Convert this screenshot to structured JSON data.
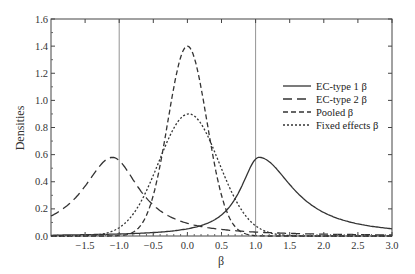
{
  "chart_data": {
    "type": "line",
    "title": "",
    "xlabel": "β",
    "ylabel": "Densities",
    "xlim": [
      -2.0,
      3.0
    ],
    "ylim": [
      0.0,
      1.6
    ],
    "grid": false,
    "legend_position": "right-center inside",
    "x_ticks": [
      -1.5,
      -1.0,
      -0.5,
      0.0,
      0.5,
      1.0,
      1.5,
      2.0,
      2.5,
      3.0
    ],
    "x_tick_labels": [
      "−1.5",
      "−1.0",
      "−0.5",
      "0.0",
      "0.5",
      "1.0",
      "1.5",
      "2.0",
      "2.5",
      "3.0"
    ],
    "y_ticks": [
      0.0,
      0.2,
      0.4,
      0.6,
      0.8,
      1.0,
      1.2,
      1.4,
      1.6
    ],
    "y_tick_labels": [
      "0.0",
      "0.2",
      "0.4",
      "0.6",
      "0.8",
      "1.0",
      "1.2",
      "1.4",
      "1.6"
    ],
    "reference_lines": [
      {
        "axis": "x",
        "value": -1.0
      },
      {
        "axis": "x",
        "value": 1.0
      }
    ],
    "x": [
      -2.0,
      -1.5,
      -1.0,
      -0.5,
      0.0,
      0.5,
      1.0,
      1.5,
      2.0,
      2.5,
      3.0
    ],
    "series": [
      {
        "name": "EC-type 1 β",
        "style": "solid",
        "peak": {
          "x": 1.05,
          "y": 0.58
        },
        "values": [
          0.0,
          0.01,
          0.02,
          0.06,
          0.13,
          0.27,
          0.57,
          0.45,
          0.24,
          0.13,
          0.07
        ]
      },
      {
        "name": "EC-type 2 β",
        "style": "long-dash",
        "peak": {
          "x": -1.1,
          "y": 0.58
        },
        "values": [
          0.22,
          0.48,
          0.57,
          0.35,
          0.17,
          0.08,
          0.03,
          0.01,
          0.0,
          0.0,
          0.0
        ]
      },
      {
        "name": "Pooled β",
        "style": "dash",
        "peak": {
          "x": 0.0,
          "y": 1.4
        },
        "values": [
          0.0,
          0.0,
          0.0,
          0.25,
          1.4,
          0.25,
          0.0,
          0.0,
          0.0,
          0.0,
          0.0
        ]
      },
      {
        "name": "Fixed effects β",
        "style": "dot",
        "peak": {
          "x": 0.02,
          "y": 0.9
        },
        "values": [
          0.0,
          0.02,
          0.12,
          0.4,
          0.9,
          0.4,
          0.12,
          0.03,
          0.01,
          0.0,
          0.0
        ]
      }
    ]
  },
  "legend": {
    "items": [
      {
        "label": "EC-type 1 β",
        "dash": ""
      },
      {
        "label": "EC-type 2 β",
        "dash": "9,5"
      },
      {
        "label": "Pooled β",
        "dash": "5,3"
      },
      {
        "label": "Fixed effects β",
        "dash": "2,2"
      }
    ]
  },
  "axes": {
    "xlabel": "β",
    "ylabel": "Densities"
  }
}
